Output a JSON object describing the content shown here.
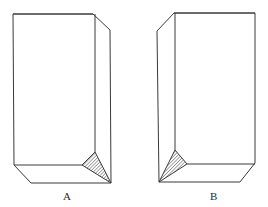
{
  "figure": {
    "stroke_color": "#3a3a3a",
    "background": "#ffffff",
    "blocks": [
      {
        "label": "A",
        "outline": "13,14 93,14 110,30 111,183 31,183 14,165",
        "front_top_edge": "13,14 93,14",
        "front_right_edge": "95,14 95,152",
        "front_bottom_edge": "14,165 82,165",
        "hatched_facet": "82,165 95,152 111,183",
        "label_pos": [
          63,
          200
        ]
      },
      {
        "label": "B",
        "outline": "157,31 174,13 255,13 255,163 240,182 159,182",
        "front_top_edge": "174,13 255,13",
        "front_left_edge": "175,13 175,150",
        "front_bottom_edge": "187,164 255,164",
        "hatched_facet": "175,150 187,164 159,182",
        "label_pos": [
          210,
          200
        ]
      }
    ]
  }
}
